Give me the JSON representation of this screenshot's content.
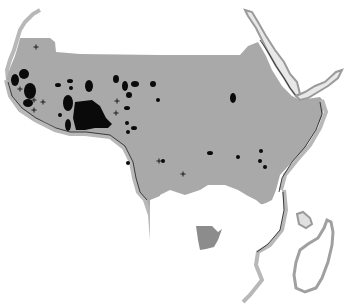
{
  "map": {
    "title": "",
    "width": 353,
    "height": 304,
    "colors": {
      "background": "#ffffff",
      "shaded_region": "#a9a9a9",
      "coast_band": "#b8b8b8",
      "coast_line": "#1a1a1a",
      "spot": "#0a0a0a",
      "southern_patch": "#8c8c8c"
    },
    "legend": [],
    "labels": [],
    "features": {
      "shaded_region": "central-african-belt",
      "southern_patch": "isolated-southern-area",
      "islands": [
        "madagascar",
        "comoros"
      ],
      "seas": [
        "red-sea",
        "gulf-of-aden"
      ]
    },
    "spots": [
      {
        "cx": 24,
        "cy": 74,
        "rx": 5,
        "ry": 5
      },
      {
        "cx": 15,
        "cy": 80,
        "rx": 4,
        "ry": 6
      },
      {
        "cx": 30,
        "cy": 91,
        "rx": 6,
        "ry": 8
      },
      {
        "cx": 28,
        "cy": 103,
        "rx": 5,
        "ry": 4
      },
      {
        "cx": 58,
        "cy": 85,
        "rx": 3,
        "ry": 2
      },
      {
        "cx": 70,
        "cy": 81,
        "rx": 3,
        "ry": 2
      },
      {
        "cx": 71,
        "cy": 88,
        "rx": 2,
        "ry": 2
      },
      {
        "cx": 89,
        "cy": 86,
        "rx": 4,
        "ry": 6
      },
      {
        "cx": 68,
        "cy": 103,
        "rx": 5,
        "ry": 8
      },
      {
        "cx": 60,
        "cy": 115,
        "rx": 2,
        "ry": 2
      },
      {
        "cx": 68,
        "cy": 125,
        "rx": 3,
        "ry": 6
      },
      {
        "cx": 116,
        "cy": 79,
        "rx": 3,
        "ry": 4
      },
      {
        "cx": 125,
        "cy": 86,
        "rx": 3,
        "ry": 5
      },
      {
        "cx": 135,
        "cy": 84,
        "rx": 4,
        "ry": 3
      },
      {
        "cx": 153,
        "cy": 84,
        "rx": 3,
        "ry": 3
      },
      {
        "cx": 129,
        "cy": 95,
        "rx": 3,
        "ry": 3
      },
      {
        "cx": 158,
        "cy": 100,
        "rx": 2,
        "ry": 2
      },
      {
        "cx": 127,
        "cy": 108,
        "rx": 3,
        "ry": 2
      },
      {
        "cx": 127,
        "cy": 123,
        "rx": 2,
        "ry": 2
      },
      {
        "cx": 134,
        "cy": 128,
        "rx": 3,
        "ry": 2
      },
      {
        "cx": 128,
        "cy": 132,
        "rx": 2,
        "ry": 2
      },
      {
        "cx": 233,
        "cy": 98,
        "rx": 3,
        "ry": 5
      },
      {
        "cx": 163,
        "cy": 161,
        "rx": 2,
        "ry": 2
      },
      {
        "cx": 210,
        "cy": 153,
        "rx": 3,
        "ry": 2
      },
      {
        "cx": 238,
        "cy": 157,
        "rx": 2,
        "ry": 2
      },
      {
        "cx": 261,
        "cy": 151,
        "rx": 2,
        "ry": 2
      },
      {
        "cx": 260,
        "cy": 161,
        "rx": 2,
        "ry": 2
      },
      {
        "cx": 265,
        "cy": 167,
        "rx": 2,
        "ry": 2
      },
      {
        "cx": 128,
        "cy": 163,
        "rx": 2,
        "ry": 2
      }
    ],
    "crosses": [
      {
        "x": 36,
        "y": 47
      },
      {
        "x": 20,
        "y": 89
      },
      {
        "x": 34,
        "y": 100
      },
      {
        "x": 43,
        "y": 102
      },
      {
        "x": 34,
        "y": 110
      },
      {
        "x": 117,
        "y": 101
      },
      {
        "x": 116,
        "y": 113
      },
      {
        "x": 159,
        "y": 161
      },
      {
        "x": 183,
        "y": 174
      }
    ]
  }
}
